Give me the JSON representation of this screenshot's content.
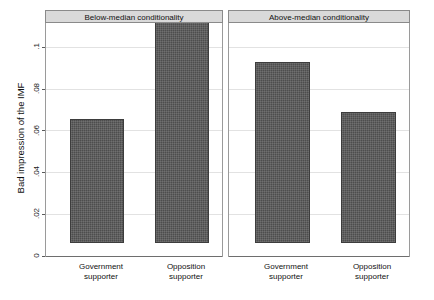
{
  "chart_data": {
    "type": "bar",
    "title": "",
    "xlabel": "",
    "ylabel": "Bad impression of the IMF",
    "ylim": [
      0,
      0.112
    ],
    "yticks": [
      0,
      0.02,
      0.04,
      0.06,
      0.08,
      0.1
    ],
    "ytick_labels": [
      "0",
      ".02",
      ".04",
      ".06",
      ".08",
      ".1"
    ],
    "grid": true,
    "legend": "none",
    "categories": [
      "Government supporter",
      "Opposition supporter"
    ],
    "panels": [
      {
        "title": "Below-median conditionality",
        "categories": [
          "Government supporter",
          "Opposition supporter"
        ],
        "values": [
          0.0595,
          0.1065
        ]
      },
      {
        "title": "Above-median conditionality",
        "categories": [
          "Government supporter",
          "Opposition supporter"
        ],
        "values": [
          0.0867,
          0.0625
        ]
      }
    ],
    "bar_color": "#4d4d4d",
    "panel_header_color": "#d9d9d9",
    "grid_color": "#e2e2e2"
  },
  "axis": {
    "y_title": "Bad impression of the IMF",
    "ticks": [
      {
        "label": ".1",
        "value": 0.1
      },
      {
        "label": ".08",
        "value": 0.08
      },
      {
        "label": ".06",
        "value": 0.06
      },
      {
        "label": ".04",
        "value": 0.04
      },
      {
        "label": ".02",
        "value": 0.02
      },
      {
        "label": "0",
        "value": 0
      }
    ]
  },
  "panels": [
    {
      "header": "Below-median conditionality",
      "bars": [
        {
          "label_line1": "Government",
          "label_line2": "supporter",
          "value": 0.0595
        },
        {
          "label_line1": "Opposition",
          "label_line2": "supporter",
          "value": 0.1065
        }
      ]
    },
    {
      "header": "Above-median conditionality",
      "bars": [
        {
          "label_line1": "Government",
          "label_line2": "supporter",
          "value": 0.0867
        },
        {
          "label_line1": "Opposition",
          "label_line2": "supporter",
          "value": 0.0625
        }
      ]
    }
  ]
}
